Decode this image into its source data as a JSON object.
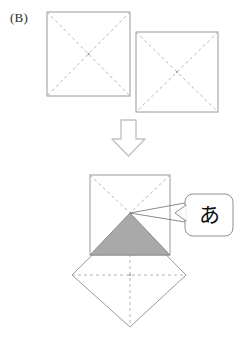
{
  "figure": {
    "panel_label": "(B)",
    "callout_label": "あ",
    "colors": {
      "outline": "#9a9a9a",
      "dashed": "#b4b4b4",
      "shaded_fill": "#a9a9a9",
      "shaded_stroke": "#8c8c8c",
      "arrow_stroke": "#c2c2c2",
      "callout_stroke": "#8f8f8f",
      "leader_stroke": "#6f6f6f",
      "text": "#2b2b2b",
      "background": "#ffffff"
    },
    "top_squares": [
      {
        "name": "square-left",
        "x": 47,
        "y": 12,
        "width": 83,
        "height": 84,
        "diagonals": "dashed"
      },
      {
        "name": "square-right",
        "x": 136,
        "y": 32,
        "width": 82,
        "height": 80,
        "diagonals": "dashed"
      }
    ],
    "arrow": {
      "name": "down-arrow",
      "direction": "down",
      "x": 112,
      "y": 120,
      "width": 33,
      "height": 36
    },
    "result": {
      "square": {
        "x": 90,
        "y": 175,
        "width": 80,
        "height": 80
      },
      "apex": {
        "x": 130,
        "y": 213
      },
      "shaded_triangle": {
        "points": "130,213 90,255 170,255",
        "fill": "#a9a9a9"
      },
      "diamond": {
        "top": {
          "x": 130,
          "y": 218
        },
        "left": {
          "x": 72,
          "y": 275
        },
        "right": {
          "x": 186,
          "y": 275
        },
        "bottom": {
          "x": 130,
          "y": 327
        }
      }
    },
    "callout": {
      "name": "callout-box",
      "x": 185,
      "y": 194,
      "width": 48,
      "height": 42,
      "radius": 8,
      "tail_target": {
        "x": 130,
        "y": 213
      }
    }
  }
}
